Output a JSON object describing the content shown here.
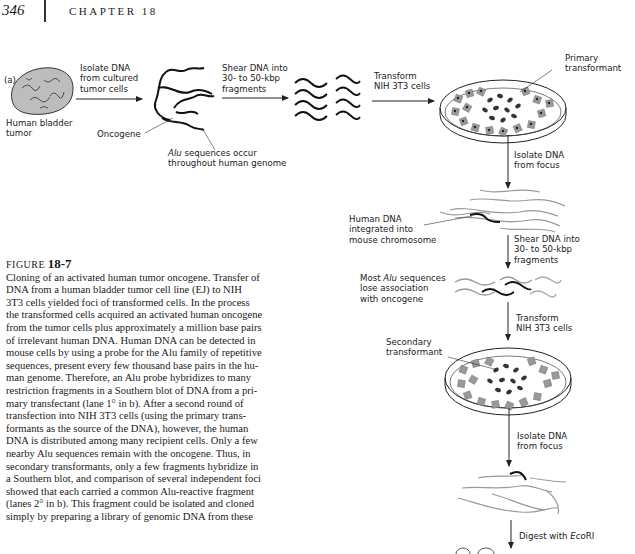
{
  "header": {
    "page_number": "346",
    "chapter_label": "CHAPTER 18"
  },
  "figure": {
    "panel_label": "(a)",
    "labels": {
      "tumor": "Human bladder tumor",
      "tumor_l1": "Human bladder",
      "tumor_l2": "tumor",
      "step1_l1": "Isolate DNA",
      "step1_l2": "from cultured",
      "step1_l3": "tumor cells",
      "oncogene": "Oncogene",
      "alu_italic": "Alu",
      "alu_l1_rest": " sequences occur",
      "alu_l2": "throughout human genome",
      "step2_l1": "Shear DNA into",
      "step2_l2": "30- to 50-kbp",
      "step2_l3": "fragments",
      "step3_l1": "Transform",
      "step3_l2": "NIH 3T3 cells",
      "primary_l1": "Primary",
      "primary_l2": "transformant",
      "step4_l1": "Isolate DNA",
      "step4_l2": "from focus",
      "human_dna_l1": "Human DNA",
      "human_dna_l2": "integrated into",
      "human_dna_l3": "mouse chromosome",
      "step5_l1": "Shear DNA into",
      "step5_l2": "30- to 50-kbp",
      "step5_l3": "fragments",
      "most_alu_l1_pre": "Most ",
      "most_alu_italic": "Alu",
      "most_alu_l1_rest": " sequences",
      "most_alu_l2": "lose association",
      "most_alu_l3": "with oncogene",
      "step6_l1": "Transform",
      "step6_l2": "NIH 3T3 cells",
      "secondary_l1": "Secondary",
      "secondary_l2": "transformant",
      "step7_l1": "Isolate DNA",
      "step7_l2": "from focus",
      "step8_pre": "Digest with ",
      "step8_italic": "Eco",
      "step8_rest": "RI"
    }
  },
  "caption": {
    "figure_word": "FIGURE",
    "figure_number": "18-7",
    "lines": [
      "Cloning of an activated human tumor oncogene. Transfer of",
      "DNA from a human bladder tumor cell line (EJ) to NIH",
      "3T3 cells yielded foci of transformed cells. In the process",
      "the transformed cells acquired an activated human oncogene",
      "from the tumor cells plus approximately a million base pairs",
      "of irrelevant human DNA. Human DNA can be detected in",
      "mouse cells by using a probe for the Alu family of repetitive",
      "sequences, present every few thousand base pairs in the hu-",
      "man genome. Therefore, an Alu probe hybridizes to many",
      "restriction fragments in a Southern blot of DNA from a pri-",
      "mary transfectant (lane 1° in b). After a second round of",
      "transfection into NIH 3T3 cells (using the primary trans-",
      "formants as the source of the DNA), however, the human",
      "DNA is distributed among many recipient cells. Only a few",
      "nearby Alu sequences remain with the oncogene. Thus, in",
      "secondary transformants, only a few fragments hybridize in",
      "a Southern blot, and comparison of several independent foci",
      "showed that each carried a common Alu-reactive fragment",
      "(lanes 2° in b). This fragment could be isolated and cloned",
      "simply by preparing a library of genomic DNA from these"
    ]
  }
}
